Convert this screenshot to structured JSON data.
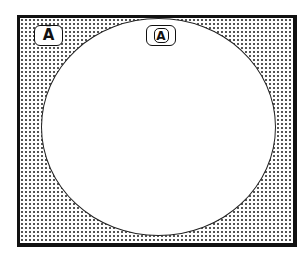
{
  "diagram": {
    "frame": {
      "border_color": "#111111",
      "fill_pattern": "halftone-dots",
      "dot_color": "#555555",
      "background": "#ffffff"
    },
    "ellipse": {
      "fill": "#ffffff",
      "stroke": "#222222"
    },
    "labels": [
      {
        "text": "Ā",
        "icon": "a-macron-badge"
      },
      {
        "text": "A",
        "icon": "a-circled-badge"
      }
    ]
  }
}
